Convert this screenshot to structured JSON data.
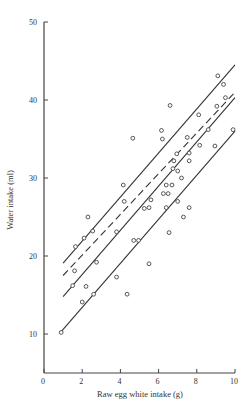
{
  "chart_data": {
    "type": "scatter",
    "title": "",
    "xlabel": "Raw egg white intake (g)",
    "ylabel": "Water intake (ml)",
    "xlim": [
      0,
      10
    ],
    "ylim": [
      5,
      50
    ],
    "x_ticks": [
      0,
      2,
      4,
      6,
      8,
      10
    ],
    "y_ticks": [
      10,
      20,
      30,
      40,
      50
    ],
    "grid": false,
    "legend": null,
    "series": [
      {
        "name": "observations",
        "marker": "open-circle",
        "points": [
          [
            0.9,
            10.2
          ],
          [
            2.0,
            14.1
          ],
          [
            2.6,
            15.1
          ],
          [
            2.2,
            16.1
          ],
          [
            1.5,
            16.2
          ],
          [
            3.8,
            17.3
          ],
          [
            1.6,
            18.1
          ],
          [
            2.75,
            19.2
          ],
          [
            5.5,
            19.0
          ],
          [
            1.65,
            21.2
          ],
          [
            2.1,
            22.3
          ],
          [
            2.55,
            23.2
          ],
          [
            3.8,
            23.1
          ],
          [
            2.3,
            25.0
          ],
          [
            4.7,
            22.0
          ],
          [
            4.95,
            22.0
          ],
          [
            4.35,
            15.1
          ],
          [
            4.2,
            27.0
          ],
          [
            4.15,
            29.1
          ],
          [
            4.65,
            35.1
          ],
          [
            5.25,
            26.1
          ],
          [
            5.5,
            26.2
          ],
          [
            5.6,
            27.2
          ],
          [
            6.4,
            26.2
          ],
          [
            7.6,
            26.2
          ],
          [
            7.3,
            25.0
          ],
          [
            6.55,
            23.0
          ],
          [
            7.0,
            27.0
          ],
          [
            6.25,
            28.0
          ],
          [
            6.5,
            28.0
          ],
          [
            6.4,
            29.1
          ],
          [
            6.7,
            29.1
          ],
          [
            7.2,
            30.0
          ],
          [
            7.0,
            30.9
          ],
          [
            6.75,
            31.2
          ],
          [
            6.8,
            32.2
          ],
          [
            7.6,
            32.2
          ],
          [
            6.95,
            33.1
          ],
          [
            7.6,
            33.2
          ],
          [
            6.15,
            36.1
          ],
          [
            6.2,
            35.0
          ],
          [
            7.5,
            35.2
          ],
          [
            6.6,
            39.3
          ],
          [
            8.1,
            38.1
          ],
          [
            8.6,
            36.2
          ],
          [
            9.9,
            36.2
          ],
          [
            8.15,
            34.2
          ],
          [
            8.95,
            34.1
          ],
          [
            9.05,
            39.2
          ],
          [
            9.1,
            43.1
          ],
          [
            9.4,
            42.0
          ],
          [
            9.5,
            40.3
          ]
        ]
      }
    ],
    "lines": [
      {
        "name": "upper-bound",
        "style": "solid",
        "from": [
          1.0,
          19.1
        ],
        "to": [
          10.0,
          44.5
        ]
      },
      {
        "name": "regression",
        "style": "dashed",
        "from": [
          1.0,
          17.5
        ],
        "to": [
          10.0,
          41.0
        ]
      },
      {
        "name": "middle-bound",
        "style": "solid",
        "from": [
          1.0,
          14.8
        ],
        "to": [
          10.0,
          40.3
        ]
      },
      {
        "name": "lower-bound",
        "style": "solid",
        "from": [
          0.9,
          10.3
        ],
        "to": [
          10.0,
          36.0
        ]
      }
    ]
  },
  "layout": {
    "plot_left_px": 44,
    "plot_right_px": 235,
    "y50_px": 22,
    "y5_px": 373
  }
}
